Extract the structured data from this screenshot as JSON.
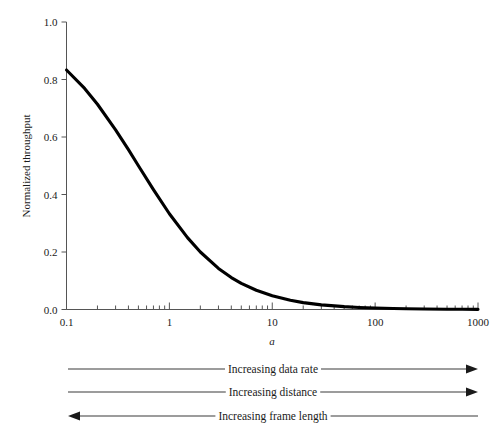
{
  "chart_data": {
    "type": "line",
    "title": "",
    "subtitle": "",
    "xlabel": "a",
    "ylabel": "Normalized throughput",
    "xscale": "log",
    "yscale": "linear",
    "xlim": [
      0.1,
      1000
    ],
    "ylim": [
      0.0,
      1.0
    ],
    "grid": false,
    "legend": null,
    "x_tick_labels": [
      "0.1",
      "1",
      "10",
      "100",
      "1000"
    ],
    "x_tick_values": [
      0.1,
      1,
      10,
      100,
      1000
    ],
    "y_tick_labels": [
      "0.0",
      "0.2",
      "0.4",
      "0.6",
      "0.8",
      "1.0"
    ],
    "y_tick_values": [
      0.0,
      0.2,
      0.4,
      0.6,
      0.8,
      1.0
    ],
    "series": [
      {
        "name": "Normalized throughput",
        "color": "#000000",
        "formula": "S = 1 / (1 + 2a)",
        "x": [
          0.1,
          0.15,
          0.2,
          0.3,
          0.4,
          0.5,
          0.7,
          1,
          1.5,
          2,
          3,
          4,
          5,
          7,
          10,
          15,
          20,
          30,
          50,
          70,
          100,
          150,
          200,
          300,
          500,
          700,
          1000
        ],
        "y": [
          0.833,
          0.769,
          0.714,
          0.625,
          0.556,
          0.5,
          0.417,
          0.333,
          0.25,
          0.2,
          0.143,
          0.111,
          0.091,
          0.067,
          0.048,
          0.032,
          0.024,
          0.016,
          0.0099,
          0.0071,
          0.005,
          0.0033,
          0.0025,
          0.0017,
          0.001,
          0.0007,
          0.0005
        ]
      }
    ],
    "annotations": [
      {
        "id": "increasing-data-rate",
        "label": "Increasing data rate",
        "direction": "right"
      },
      {
        "id": "increasing-distance",
        "label": "Increasing distance",
        "direction": "right"
      },
      {
        "id": "increasing-frame-length",
        "label": "Increasing frame length",
        "direction": "left"
      }
    ]
  },
  "axes": {
    "y_title": "Normalized throughput",
    "x_title": "a"
  }
}
